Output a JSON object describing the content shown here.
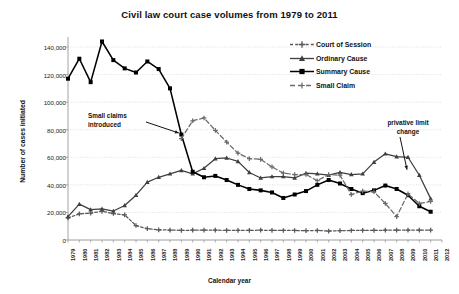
{
  "chart_data": {
    "type": "line",
    "title": "Civil law court case volumes from 1979 to 2011",
    "xlabel": "Calendar year",
    "ylabel": "Number of cases initiated",
    "xlim": [
      1979,
      2012
    ],
    "ylim": [
      0,
      140000
    ],
    "ytick_labels": [
      "0",
      "20,000",
      "40,000",
      "60,000",
      "80,000",
      "100,000",
      "120,000",
      "140,000"
    ],
    "ytick_values": [
      0,
      20000,
      40000,
      60000,
      80000,
      100000,
      120000,
      140000
    ],
    "grid": true,
    "legend_position": "top-right",
    "x": [
      1979,
      1980,
      1981,
      1982,
      1983,
      1984,
      1985,
      1986,
      1987,
      1988,
      1989,
      1990,
      1991,
      1992,
      1993,
      1994,
      1995,
      1996,
      1997,
      1998,
      1999,
      2000,
      2001,
      2002,
      2003,
      2004,
      2005,
      2006,
      2007,
      2008,
      2009,
      2010,
      2011
    ],
    "categories": [
      "1979",
      "1980",
      "1981",
      "1982",
      "1983",
      "1984",
      "1985",
      "1986",
      "1987",
      "1988",
      "1989",
      "1990",
      "1991",
      "1992",
      "1993",
      "1994",
      "1995",
      "1996",
      "1997",
      "1998",
      "1999",
      "2000",
      "2001",
      "2002",
      "2003",
      "2004",
      "2005",
      "2006",
      "2007",
      "2008",
      "2009",
      "2010",
      "2011"
    ],
    "xtick_labels": [
      "1979",
      "1980",
      "1981",
      "1982",
      "1983",
      "1984",
      "1985",
      "1986",
      "1987",
      "1988",
      "1989",
      "1990",
      "1991",
      "1992",
      "1993",
      "1994",
      "1995",
      "1996",
      "1997",
      "1998",
      "1999",
      "2000",
      "2001",
      "2002",
      "2003",
      "2004",
      "2005",
      "2006",
      "2007",
      "2008",
      "2009",
      "2010",
      "2011",
      "2012"
    ],
    "series": [
      {
        "name": "Court of Session",
        "style": "dashed",
        "marker": "cross",
        "color": "#595959",
        "values": [
          16000,
          19000,
          19500,
          20800,
          19200,
          18200,
          10500,
          8200,
          7400,
          7200,
          7000,
          7100,
          7200,
          7100,
          7000,
          7000,
          7000,
          7100,
          7000,
          6900,
          6900,
          6800,
          6900,
          6500,
          6800,
          6900,
          7000,
          7000,
          7100,
          7200,
          7200,
          7200,
          7200
        ]
      },
      {
        "name": "Ordinary Cause",
        "style": "solid",
        "marker": "triangle",
        "color": "#3f3f3f",
        "values": [
          17000,
          26000,
          22000,
          22500,
          21000,
          25000,
          32500,
          42000,
          45500,
          48000,
          50500,
          48000,
          52000,
          59000,
          59500,
          57000,
          49000,
          45000,
          46000,
          46000,
          45000,
          48500,
          48000,
          47000,
          49000,
          47500,
          48000,
          56500,
          62500,
          60500,
          60000,
          47000,
          30000
        ]
      },
      {
        "name": "Summary Cause",
        "style": "solid",
        "marker": "square",
        "color": "#000000",
        "values": [
          117000,
          131500,
          114500,
          144000,
          130500,
          124500,
          121500,
          129500,
          124000,
          110000,
          76500,
          49500,
          45500,
          46500,
          43500,
          40000,
          37000,
          36000,
          34500,
          30500,
          33000,
          35500,
          40000,
          43500,
          41000,
          37000,
          34000,
          36000,
          39500,
          37000,
          32500,
          24500,
          20500
        ]
      },
      {
        "name": "Small Claim",
        "style": "dashed",
        "marker": "cross",
        "color": "#6b6b6b",
        "values": [
          null,
          null,
          null,
          null,
          null,
          null,
          null,
          null,
          null,
          null,
          73500,
          86500,
          88500,
          79500,
          71000,
          63000,
          59000,
          58500,
          53000,
          48500,
          47500,
          47500,
          43000,
          47500,
          47000,
          33000,
          35500,
          35000,
          26500,
          17000,
          33500,
          26500,
          28000
        ]
      }
    ],
    "annotations": [
      {
        "text_line1": "Small claims",
        "text_line2": "introduced",
        "points_to_year": 1989
      },
      {
        "text_line1": "privative limit",
        "text_line2": "change",
        "points_to_year": 2009
      }
    ]
  }
}
